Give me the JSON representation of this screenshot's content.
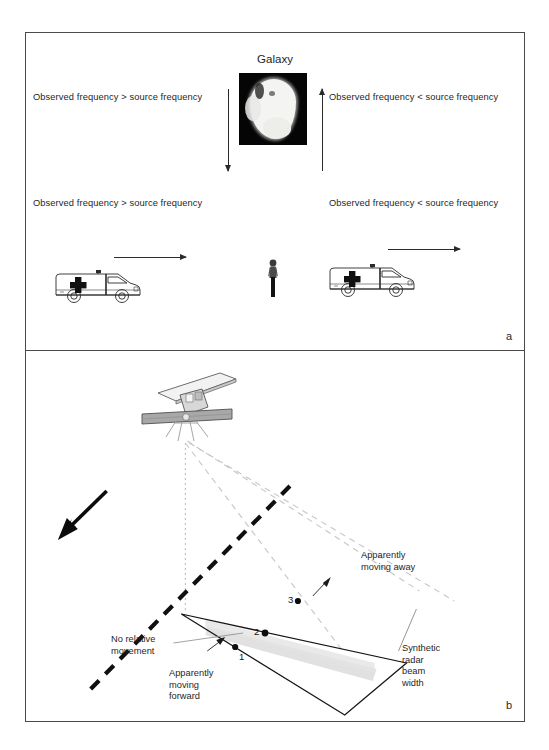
{
  "figure": {
    "panel_a": {
      "letter": "a",
      "galaxy_title": "Galaxy",
      "galaxy_image_name": "galaxy-photo",
      "labels": {
        "top_left": "Observed frequency > source frequency",
        "top_right": "Observed frequency < source frequency",
        "bottom_left": "Observed frequency > source frequency",
        "bottom_right": "Observed frequency < source frequency"
      },
      "icons": {
        "arrow_down_left": "arrow-down-icon",
        "arrow_up_right": "arrow-up-icon",
        "arrow_motion_left": "arrow-right-icon",
        "arrow_motion_right": "arrow-right-icon",
        "ambulance_left": "ambulance-icon",
        "ambulance_right": "ambulance-icon",
        "observer": "person-icon"
      }
    },
    "panel_b": {
      "letter": "b",
      "labels": {
        "apparently_moving_away": "Apparently\nmoving away",
        "no_relative_movement": "No relative\nmovement",
        "apparently_moving_forward": "Apparently\nmoving\nforward",
        "synthetic_beam": "Synthetic\nradar\nbeam\nwidth"
      },
      "label_lines": {
        "apparently_moving_away": [
          "Apparently",
          "moving away"
        ],
        "no_relative_movement": [
          "No relative",
          "movement"
        ],
        "apparently_moving_forward": [
          "Apparently",
          "moving",
          "forward"
        ],
        "synthetic_beam": [
          "Synthetic",
          "radar",
          "beam",
          "width"
        ]
      },
      "point_numbers": [
        "1",
        "2",
        "3"
      ],
      "icons": {
        "satellite": "satellite-icon",
        "flight_direction_arrow": "arrow-down-left-icon",
        "ground_track_dashed": "dashed-line",
        "nadir_line": "dotted-line",
        "beam_edges": "dashed-beam-lines",
        "beam_swath": "grey-beam-band"
      }
    },
    "colors": {
      "frame": "#4a4a4a",
      "text": "#1f1f1f",
      "galaxy_background": "#050505",
      "galaxy_blob": "#f4f4f2",
      "beam_band": "#d9d9d9",
      "beam_dash": "#c8c8c8",
      "solid_line": "#1a1a1a"
    }
  }
}
